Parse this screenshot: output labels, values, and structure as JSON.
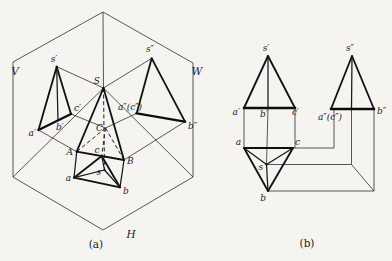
{
  "colors": {
    "ink": "#1c1c1c",
    "paper": "#f5f4f0"
  },
  "panel_a": {
    "caption": "(a)",
    "plane_labels": {
      "vertical": "V",
      "side": "W",
      "horizontal": "H"
    },
    "space_points": {
      "apex": "S",
      "base_a": "A",
      "base_b": "B",
      "base_c": "C"
    },
    "front_view": {
      "apex": "s′",
      "a": "a′",
      "b": "b′",
      "c": "c′"
    },
    "side_view": {
      "apex": "s″",
      "ac": "a″(c″)",
      "b": "b″"
    },
    "top_view": {
      "apex": "s",
      "a": "a",
      "b": "b",
      "c": "c"
    }
  },
  "panel_b": {
    "caption": "(b)",
    "front_view": {
      "apex": "s′",
      "a": "a′",
      "b": "b′",
      "c": "c′"
    },
    "side_view": {
      "apex": "s″",
      "ac": "a″(c″)",
      "b": "b″"
    },
    "top_view": {
      "apex": "s",
      "a": "a",
      "b": "b",
      "c": "c"
    }
  }
}
